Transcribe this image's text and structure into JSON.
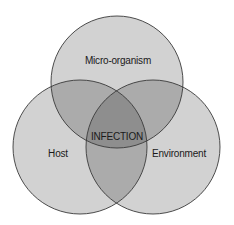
{
  "diagram": {
    "type": "venn",
    "sets": [
      {
        "id": "micro",
        "label": "Micro-organism",
        "cx": 117,
        "cy": 82,
        "r": 66
      },
      {
        "id": "host",
        "label": "Host",
        "cx": 80,
        "cy": 147,
        "r": 67
      },
      {
        "id": "env",
        "label": "Environment",
        "cx": 153,
        "cy": 147,
        "r": 67
      }
    ],
    "intersection_label": "INFECTION",
    "colors": {
      "single": "#d2d2d2",
      "double": "#ababab",
      "triple": "#8e8e8e",
      "stroke": "#3a3a3a",
      "background": "#ffffff"
    }
  }
}
